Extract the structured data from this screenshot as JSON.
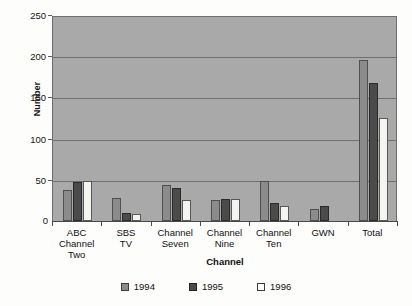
{
  "chart_data": {
    "type": "bar",
    "title": "",
    "xlabel": "Channel",
    "ylabel": "Number",
    "ylim": [
      0,
      250
    ],
    "yticks": [
      0,
      50,
      100,
      150,
      200,
      250
    ],
    "grid": true,
    "legend_position": "bottom",
    "categories": [
      "ABC\nChannel Two",
      "SBS\nTV",
      "Channel\nSeven",
      "Channel\nNine",
      "Channel\nTen",
      "GWN",
      "Total"
    ],
    "series": [
      {
        "name": "1994",
        "color": "#8b8b8b",
        "values": [
          38,
          28,
          44,
          26,
          48,
          14,
          195
        ]
      },
      {
        "name": "1995",
        "color": "#4b4b4b",
        "values": [
          47,
          10,
          40,
          27,
          22,
          18,
          168
        ]
      },
      {
        "name": "1996",
        "color": "#f4f4f0",
        "values": [
          48,
          8,
          26,
          27,
          18,
          0,
          125
        ]
      }
    ]
  },
  "axes": {
    "y_title": "Number",
    "x_title": "Channel",
    "zero_label": "0"
  },
  "legend": {
    "items": [
      {
        "label": "1994",
        "swatch": "legend-swatch-1994"
      },
      {
        "label": "1995",
        "swatch": "legend-swatch-1995"
      },
      {
        "label": "1996",
        "swatch": "legend-swatch-1996"
      }
    ]
  },
  "colors": {
    "plot_background": "#a9a9a9",
    "page_background": "#fdfdfb",
    "gridline": "#6f6f6f",
    "axis": "#4a4a4a",
    "series_1994": "#8b8b8b",
    "series_1995": "#4b4b4b",
    "series_1996": "#f4f4f0"
  }
}
